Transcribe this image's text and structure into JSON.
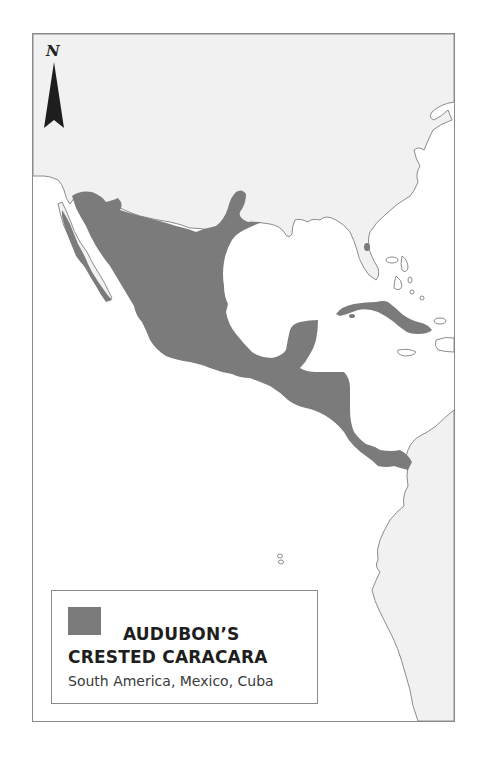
{
  "map": {
    "north_arrow_label": "N",
    "colors": {
      "land": "#f1f1f1",
      "sea": "#ffffff",
      "range": "#7b7b7b",
      "coastline": "#8c8c8c",
      "frame": "#8a8a8a"
    }
  },
  "legend": {
    "title_line1": "AUDUBON’S",
    "title_line2": "CRESTED CARACARA",
    "subtitle": "South America, Mexico, Cuba",
    "swatch_color": "#7b7b7b"
  }
}
